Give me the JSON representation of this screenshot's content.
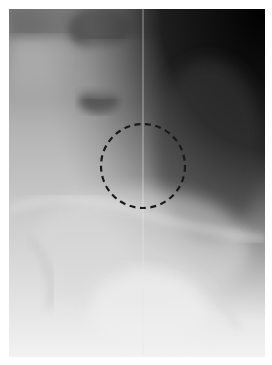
{
  "image": {
    "type": "radiograph",
    "view": "lateral lumbosacral spine",
    "annotation": {
      "shape": "dashed-circle",
      "center_x": 143,
      "center_y": 166,
      "radius": 42,
      "stroke_color": "#1a1a1a"
    },
    "colors": {
      "border": "#ffffff",
      "dark_region": "#0a0a0a",
      "mid_tone": "#8a8a8a",
      "light_tone": "#e6e6e6"
    }
  }
}
